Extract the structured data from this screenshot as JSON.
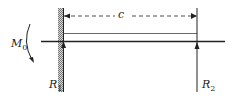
{
  "diagram": {
    "type": "beam-free-body",
    "labels": {
      "moment": "M",
      "moment_sub": "0",
      "span": "c",
      "reaction_left": "R",
      "reaction_left_sub": "1",
      "reaction_right": "R",
      "reaction_right_sub": "2"
    },
    "colors": {
      "line": "#222222",
      "hatch": "#888888"
    }
  }
}
